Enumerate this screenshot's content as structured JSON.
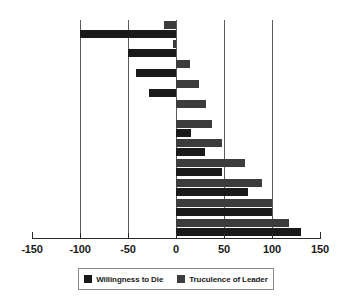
{
  "chart_data": {
    "type": "bar",
    "orientation": "horizontal",
    "title": "",
    "xlabel": "",
    "ylabel": "",
    "xlim": [
      -150,
      150
    ],
    "xticks": [
      -150,
      -100,
      -50,
      0,
      50,
      100,
      150
    ],
    "xtick_labels": [
      "-150",
      "-100",
      "-50",
      "0",
      "50",
      "100",
      "150"
    ],
    "gridlines_x": [
      -100,
      -50,
      0,
      50,
      100
    ],
    "grid": true,
    "legend_position": "bottom",
    "categories": [
      "1",
      "2",
      "3",
      "4",
      "5",
      "6",
      "7",
      "8",
      "9",
      "10",
      "11"
    ],
    "series": [
      {
        "name": "Truculence of Leader",
        "color": "#3c3c3c",
        "values": [
          -12,
          -3,
          15,
          24,
          31,
          38,
          48,
          72,
          90,
          100,
          118
        ]
      },
      {
        "name": "Willingness to Die",
        "color": "#1a1a1a",
        "values": [
          -100,
          -50,
          -42,
          -28,
          null,
          16,
          30,
          48,
          75,
          100,
          130
        ]
      }
    ]
  },
  "legend": {
    "entries": [
      {
        "label": "Willingness to Die",
        "key": "willingness"
      },
      {
        "label": "Truculence of Leader",
        "key": "truculence"
      }
    ]
  },
  "colors": {
    "willingness": "#1a1a1a",
    "truculence": "#3c3c3c",
    "gridline": "#5a5a5a",
    "axis": "#2a2a2a",
    "background": "#ffffff"
  }
}
